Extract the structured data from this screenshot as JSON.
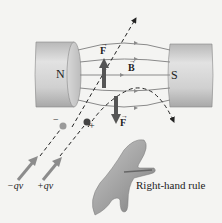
{
  "diagram": {
    "magnets": {
      "north_label": "N",
      "south_label": "S"
    },
    "vectors": {
      "field_label": "B",
      "force_up_label": "F",
      "force_down_label": "F"
    },
    "charges": {
      "negative_sign": "−",
      "positive_sign": "+",
      "negative_velocity_label": "−qv",
      "positive_velocity_label": "+qv"
    },
    "caption": "Right-hand rule",
    "colors": {
      "background": "#f4f4f2",
      "magnet": "#c9c9c9",
      "field_lines": "#8a8a8a",
      "force_arrow": "#555555",
      "dashed_path": "#222222",
      "negative_charge": "#9a9a9a",
      "positive_charge": "#444444",
      "velocity_arrow": "#8c8c8c"
    }
  }
}
